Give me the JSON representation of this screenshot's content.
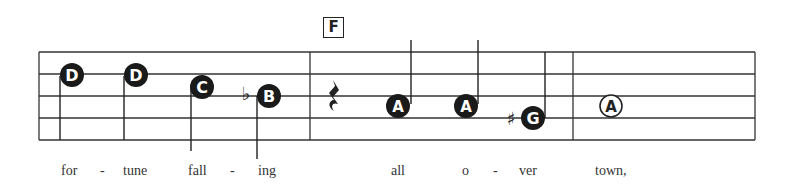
{
  "rehearsal_mark": "F",
  "notes": [
    {
      "name": "D",
      "accidental": "",
      "style": "filled",
      "stem": "down"
    },
    {
      "name": "D",
      "accidental": "",
      "style": "filled",
      "stem": "down"
    },
    {
      "name": "C",
      "accidental": "",
      "style": "filled",
      "stem": "down"
    },
    {
      "name": "B",
      "accidental": "♭",
      "style": "filled",
      "stem": "down"
    },
    {
      "name": "rest",
      "accidental": "",
      "style": "quarter-rest"
    },
    {
      "name": "A",
      "accidental": "",
      "style": "filled",
      "stem": "up"
    },
    {
      "name": "A",
      "accidental": "",
      "style": "filled",
      "stem": "up"
    },
    {
      "name": "G",
      "accidental": "♯",
      "style": "filled",
      "stem": "up"
    },
    {
      "name": "A",
      "accidental": "",
      "style": "hollow",
      "stem": "none"
    }
  ],
  "lyrics": [
    "for",
    "-",
    "tune",
    "fall",
    "-",
    "ing",
    "all",
    "o",
    "-",
    "ver",
    "town,"
  ]
}
